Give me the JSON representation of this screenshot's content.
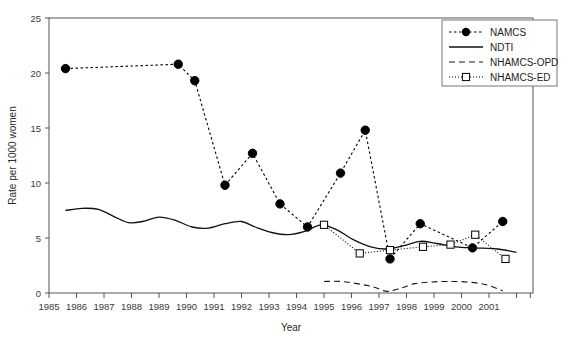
{
  "chart_data": {
    "type": "line",
    "title": "",
    "xlabel": "Year",
    "ylabel": "Rate per 1000 women",
    "xlim": [
      1985,
      2002.6
    ],
    "ylim": [
      0,
      25
    ],
    "yticks": [
      0,
      5,
      10,
      15,
      20,
      25
    ],
    "xticks": [
      1985,
      1986,
      1987,
      1988,
      1989,
      1990,
      1991,
      1992,
      1993,
      1994,
      1995,
      1996,
      1997,
      1998,
      1999,
      2000,
      2001
    ],
    "xtick_labels": [
      "1985",
      "1986",
      "1987",
      "1988",
      "1989",
      "1990",
      "1991",
      "1992",
      "1993",
      "1994",
      "1995",
      "1996",
      "1997",
      "1998",
      "1999",
      "2000",
      "2001"
    ],
    "ytick_labels": [
      "0",
      "5",
      "10",
      "15",
      "20",
      "25"
    ],
    "grid": false,
    "legend_position": "top-right",
    "series": [
      {
        "name": "NAMCS",
        "style": "dashed-marker",
        "marker": "filled-circle",
        "color": "#000000",
        "points": [
          {
            "x": 1985.6,
            "y": 20.4
          },
          {
            "x": 1989.7,
            "y": 20.8
          },
          {
            "x": 1990.3,
            "y": 19.3
          },
          {
            "x": 1991.4,
            "y": 9.8
          },
          {
            "x": 1992.4,
            "y": 12.7
          },
          {
            "x": 1993.4,
            "y": 8.1
          },
          {
            "x": 1994.4,
            "y": 6.0
          },
          {
            "x": 1995.6,
            "y": 10.9
          },
          {
            "x": 1996.5,
            "y": 14.8
          },
          {
            "x": 1997.4,
            "y": 3.1
          },
          {
            "x": 1998.5,
            "y": 6.3
          },
          {
            "x": 2000.4,
            "y": 4.1
          },
          {
            "x": 2001.5,
            "y": 6.5
          }
        ]
      },
      {
        "name": "NDTI",
        "style": "solid",
        "marker": "none",
        "color": "#111111",
        "points": [
          {
            "x": 1985.6,
            "y": 7.5
          },
          {
            "x": 1986.2,
            "y": 7.7
          },
          {
            "x": 1986.8,
            "y": 7.6
          },
          {
            "x": 1987.4,
            "y": 6.9
          },
          {
            "x": 1987.9,
            "y": 6.4
          },
          {
            "x": 1988.4,
            "y": 6.5
          },
          {
            "x": 1989.0,
            "y": 6.9
          },
          {
            "x": 1989.6,
            "y": 6.6
          },
          {
            "x": 1990.2,
            "y": 6.0
          },
          {
            "x": 1990.8,
            "y": 5.9
          },
          {
            "x": 1991.4,
            "y": 6.3
          },
          {
            "x": 1992.0,
            "y": 6.5
          },
          {
            "x": 1992.5,
            "y": 6.0
          },
          {
            "x": 1993.1,
            "y": 5.5
          },
          {
            "x": 1993.7,
            "y": 5.3
          },
          {
            "x": 1994.3,
            "y": 5.6
          },
          {
            "x": 1994.9,
            "y": 6.2
          },
          {
            "x": 1995.5,
            "y": 5.7
          },
          {
            "x": 1996.1,
            "y": 4.8
          },
          {
            "x": 1996.7,
            "y": 4.2
          },
          {
            "x": 1997.3,
            "y": 4.0
          },
          {
            "x": 1997.9,
            "y": 4.3
          },
          {
            "x": 1998.5,
            "y": 4.7
          },
          {
            "x": 1999.1,
            "y": 4.5
          },
          {
            "x": 1999.8,
            "y": 4.2
          },
          {
            "x": 2000.5,
            "y": 4.1
          },
          {
            "x": 2001.3,
            "y": 4.0
          },
          {
            "x": 2002.0,
            "y": 3.7
          }
        ]
      },
      {
        "name": "NHAMCS-OPD",
        "style": "long-dashed",
        "marker": "none",
        "color": "#1a1a1a",
        "points": [
          {
            "x": 1995.0,
            "y": 1.05
          },
          {
            "x": 1995.6,
            "y": 1.05
          },
          {
            "x": 1996.2,
            "y": 0.85
          },
          {
            "x": 1996.8,
            "y": 0.55
          },
          {
            "x": 1997.3,
            "y": 0.15
          },
          {
            "x": 1997.8,
            "y": 0.45
          },
          {
            "x": 1998.3,
            "y": 0.85
          },
          {
            "x": 1998.9,
            "y": 1.0
          },
          {
            "x": 1999.5,
            "y": 1.05
          },
          {
            "x": 2000.2,
            "y": 1.0
          },
          {
            "x": 2000.9,
            "y": 0.75
          },
          {
            "x": 2001.5,
            "y": 0.2
          }
        ]
      },
      {
        "name": "NHAMCS-ED",
        "style": "dotted-marker",
        "marker": "open-square",
        "color": "#000000",
        "points": [
          {
            "x": 1995.0,
            "y": 6.2
          },
          {
            "x": 1996.3,
            "y": 3.6
          },
          {
            "x": 1997.4,
            "y": 3.9
          },
          {
            "x": 1998.6,
            "y": 4.2
          },
          {
            "x": 1999.6,
            "y": 4.4
          },
          {
            "x": 2000.5,
            "y": 5.3
          },
          {
            "x": 2001.6,
            "y": 3.1
          }
        ]
      }
    ]
  },
  "legend": {
    "entries": [
      {
        "label": "NAMCS"
      },
      {
        "label": "NDTI"
      },
      {
        "label": "NHAMCS-OPD"
      },
      {
        "label": "NHAMCS-ED"
      }
    ]
  }
}
